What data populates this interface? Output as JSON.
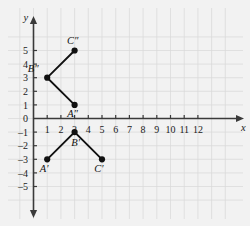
{
  "chart_data": {
    "type": "scatter",
    "title": "",
    "xlabel": "x",
    "ylabel": "y",
    "xlim": [
      -0.6,
      13.2
    ],
    "ylim": [
      -5.8,
      5.8
    ],
    "grid": true,
    "legend": "none",
    "x_ticks": [
      "1",
      "2",
      "3",
      "4",
      "5",
      "6",
      "7",
      "8",
      "9",
      "10",
      "11",
      "12"
    ],
    "x_tick_values": [
      1,
      2,
      3,
      4,
      5,
      6,
      7,
      8,
      9,
      10,
      11,
      12
    ],
    "y_ticks": [
      "5",
      "4",
      "3",
      "2",
      "1",
      "0",
      "–1",
      "–2",
      "–3",
      "–4",
      "–5"
    ],
    "y_tick_values": [
      5,
      4,
      3,
      2,
      1,
      0,
      -1,
      -2,
      -3,
      -4,
      -5
    ],
    "origin_label": "0",
    "series": [
      {
        "name": "image-double-prime",
        "type": "polyline",
        "points": [
          {
            "label": "C″",
            "x": 3,
            "y": 5,
            "label_dx": -2,
            "label_dy": -7
          },
          {
            "label": "B″",
            "x": 1,
            "y": 3,
            "label_dx": -14,
            "label_dy": -6
          },
          {
            "label": "A″",
            "x": 3,
            "y": 1,
            "label_dx": -2,
            "label_dy": 12
          }
        ]
      },
      {
        "name": "image-single-prime",
        "type": "polyline",
        "points": [
          {
            "label": "A′",
            "x": 1,
            "y": -3,
            "label_dx": -3,
            "label_dy": 13
          },
          {
            "label": "B′",
            "x": 3,
            "y": -1,
            "label_dx": 1,
            "label_dy": 14
          },
          {
            "label": "C′",
            "x": 5,
            "y": -3,
            "label_dx": -3,
            "label_dy": 13
          }
        ]
      }
    ],
    "colors": {
      "grid": "#d8d8d8",
      "axis": "#3a3a3a",
      "segment": "#111111",
      "point": "#111111",
      "background": "#f2f2f2"
    }
  }
}
